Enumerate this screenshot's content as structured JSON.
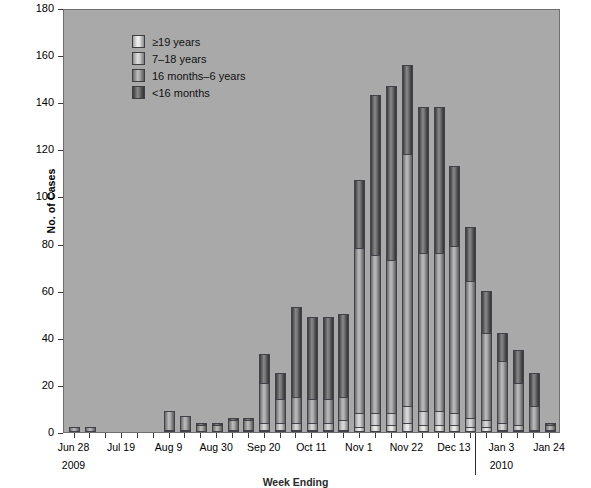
{
  "chart_data": {
    "type": "bar",
    "subtype": "stacked-bar",
    "title": "",
    "xlabel": "Week Ending",
    "ylabel": "No. of Cases",
    "ylim": [
      0,
      180
    ],
    "yticks": [
      0,
      20,
      40,
      60,
      80,
      100,
      120,
      140,
      160,
      180
    ],
    "grid": false,
    "legend_position": "top-left",
    "legend_entries": [
      "≥19 years",
      "7–18 years",
      "16 months–6 years",
      "<16 months"
    ],
    "year_divider_label": "2010",
    "xtick_labels": [
      "Jun 28",
      "Jul 19",
      "Aug 9",
      "Aug 30",
      "Sep 20",
      "Oct 11",
      "Nov 1",
      "Nov 22",
      "Dec 13",
      "Jan 3",
      "Jan 24"
    ],
    "xtick_sublabels": [
      "2009",
      "",
      "",
      "",
      "",
      "",
      "",
      "",
      "",
      "2010",
      ""
    ],
    "xtick_indices": [
      0,
      3,
      6,
      9,
      12,
      15,
      18,
      21,
      24,
      27,
      30
    ],
    "categories": [
      "Jun 28",
      "Jul 5",
      "Jul 12",
      "Jul 19",
      "Jul 26",
      "Aug 2",
      "Aug 9",
      "Aug 16",
      "Aug 23",
      "Aug 30",
      "Sep 6",
      "Sep 13",
      "Sep 20",
      "Sep 27",
      "Oct 4",
      "Oct 11",
      "Oct 18",
      "Oct 25",
      "Nov 1",
      "Nov 8",
      "Nov 15",
      "Nov 22",
      "Nov 29",
      "Dec 6",
      "Dec 13",
      "Dec 20",
      "Dec 27",
      "Jan 3",
      "Jan 10",
      "Jan 17",
      "Jan 24"
    ],
    "series": [
      {
        "name": "<16 months",
        "color": "#4a4a4a",
        "values": [
          0,
          0,
          0,
          0,
          0,
          0,
          0,
          0,
          0,
          0,
          0,
          0,
          1,
          1,
          1,
          1,
          1,
          1,
          2,
          3,
          3,
          4,
          3,
          3,
          3,
          2,
          2,
          1,
          1,
          0,
          0
        ]
      },
      {
        "name": "16 months–6 years",
        "color": "#8f8f8f",
        "values": [
          0,
          0,
          0,
          0,
          0,
          0,
          1,
          1,
          0,
          0,
          1,
          1,
          3,
          3,
          3,
          3,
          3,
          4,
          6,
          5,
          5,
          7,
          6,
          6,
          5,
          4,
          3,
          3,
          2,
          1,
          1
        ]
      },
      {
        "name": "7–18 years",
        "color": "#c3c3c3",
        "values": [
          2,
          2,
          0,
          0,
          0,
          0,
          8,
          6,
          3,
          3,
          4,
          4,
          17,
          10,
          11,
          10,
          10,
          10,
          70,
          67,
          65,
          107,
          67,
          67,
          71,
          58,
          37,
          26,
          18,
          10,
          2
        ]
      },
      {
        "name": "≥19 years",
        "color": "#e8e8e8",
        "values": [
          0,
          0,
          0,
          0,
          0,
          0,
          0,
          0,
          1,
          1,
          1,
          1,
          12,
          11,
          38,
          35,
          35,
          35,
          29,
          68,
          74,
          38,
          62,
          62,
          34,
          23,
          18,
          12,
          14,
          14,
          1
        ]
      }
    ],
    "totals": [
      2,
      2,
      0,
      0,
      0,
      0,
      9,
      7,
      4,
      4,
      6,
      6,
      33,
      25,
      53,
      49,
      49,
      50,
      107,
      143,
      147,
      156,
      138,
      138,
      113,
      87,
      60,
      42,
      35,
      25,
      4
    ]
  },
  "legend": {
    "items": [
      {
        "label": "≥19 years"
      },
      {
        "label": "7–18 years"
      },
      {
        "label": "16 months–6 years"
      },
      {
        "label": "<16 months"
      }
    ]
  },
  "axes": {
    "y_title": "No. of Cases",
    "x_title": "Week Ending"
  }
}
